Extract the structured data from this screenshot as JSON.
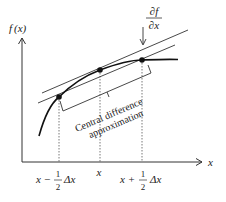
{
  "diagram": {
    "type": "central-difference-derivative-illustration",
    "y_axis_label": {
      "f": "f",
      "arg": "(x)"
    },
    "x_axis_label": "x",
    "derivative_label": {
      "numerator": "∂f",
      "denominator": "∂x"
    },
    "bracket_label": {
      "line1": "Central difference",
      "line2": "approximation"
    },
    "tick_labels": {
      "left": {
        "prefix": "x −",
        "frac_num": "1",
        "frac_den": "2",
        "suffix": "Δx"
      },
      "center": "x",
      "right": {
        "prefix": "x +",
        "frac_num": "1",
        "frac_den": "2",
        "suffix": "Δx"
      }
    },
    "points": [
      "x − ½Δx",
      "x",
      "x + ½Δx"
    ],
    "lines": [
      "tangent (true derivative ∂f/∂x)",
      "secant (central difference approximation)"
    ],
    "colors": {
      "ink": "#222222",
      "background": "#ffffff"
    }
  }
}
